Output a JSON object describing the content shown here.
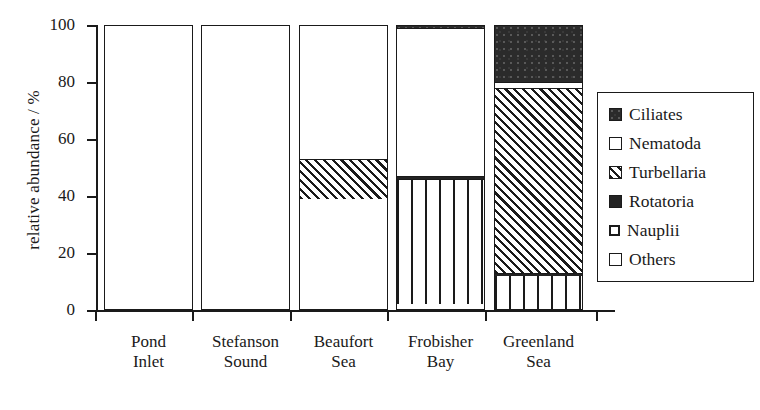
{
  "chart_data": {
    "type": "bar",
    "subtype": "stacked-percentage",
    "title": "",
    "xlabel": "",
    "ylabel": "relative abundance / %",
    "ylim": [
      0,
      100
    ],
    "yticks": [
      0,
      20,
      40,
      60,
      80,
      100
    ],
    "grid": false,
    "legend_position": "right-inside",
    "categories": [
      "Pond\nInlet",
      "Stefanson\nSound",
      "Beaufort\nSea",
      "Frobisher\nBay",
      "Greenland\nSea"
    ],
    "category_lines": [
      [
        "Pond",
        "Inlet"
      ],
      [
        "Stefanson",
        "Sound"
      ],
      [
        "Beaufort",
        "Sea"
      ],
      [
        "Frobisher",
        "Bay"
      ],
      [
        "Greenland",
        "Sea"
      ]
    ],
    "series": [
      {
        "name": "Ciliates",
        "pattern": "dark-stipple",
        "values": [
          0,
          0,
          0,
          1,
          20
        ]
      },
      {
        "name": "Nematoda",
        "pattern": "white",
        "values": [
          59,
          77,
          47,
          52,
          2
        ]
      },
      {
        "name": "Turbellaria",
        "pattern": "diagonal-hatch",
        "values": [
          0,
          0,
          14,
          0,
          65
        ]
      },
      {
        "name": "Rotatoria",
        "pattern": "solid-dark",
        "values": [
          0,
          0,
          0,
          1,
          1
        ]
      },
      {
        "name": "Nauplii",
        "pattern": "vertical-lines",
        "values": [
          0,
          0,
          0,
          44,
          12
        ]
      },
      {
        "name": "Others",
        "pattern": "white",
        "values": [
          41,
          23,
          39,
          2,
          0
        ]
      }
    ],
    "stack_order_bottom_to_top": [
      "Others",
      "Nauplii",
      "Rotatoria",
      "Turbellaria",
      "Nematoda",
      "Ciliates"
    ]
  },
  "axis": {
    "y_title": "relative abundance / %",
    "y_tick_labels": [
      "0",
      "20",
      "40",
      "60",
      "80",
      "100"
    ]
  },
  "legend": {
    "items": [
      {
        "label": "Ciliates",
        "swatch": "ciliates-swatch-icon"
      },
      {
        "label": "Nematoda",
        "swatch": "nematoda-swatch-icon"
      },
      {
        "label": "Turbellaria",
        "swatch": "turbellaria-swatch-icon"
      },
      {
        "label": "Rotatoria",
        "swatch": "rotatoria-swatch-icon"
      },
      {
        "label": "Nauplii",
        "swatch": "nauplii-swatch-icon"
      },
      {
        "label": "Others",
        "swatch": "others-swatch-icon"
      }
    ]
  },
  "xlabels": [
    {
      "line1": "Pond",
      "line2": "Inlet"
    },
    {
      "line1": "Stefanson",
      "line2": "Sound"
    },
    {
      "line1": "Beaufort",
      "line2": "Sea"
    },
    {
      "line1": "Frobisher",
      "line2": "Bay"
    },
    {
      "line1": "Greenland",
      "line2": "Sea"
    }
  ],
  "colors": {
    "ink": "#1a1a1a",
    "paper": "#ffffff",
    "dark_fill": "#2b2b2b"
  }
}
